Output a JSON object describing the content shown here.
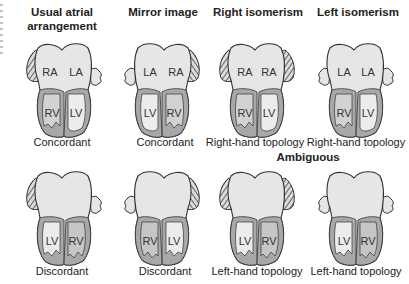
{
  "columns": [
    {
      "title": "Usual atrial arrangement",
      "title_line1": "Usual atrial",
      "title_line2": "arrangement"
    },
    {
      "title": "Mirror image"
    },
    {
      "title": "Right isomerism"
    },
    {
      "title": "Left isomerism"
    }
  ],
  "section_label": "Ambiguous",
  "top_row": [
    {
      "left_atrium": "RA",
      "right_atrium": "LA",
      "left_ventricle": "RV",
      "right_ventricle": "LV",
      "caption": "Concordant"
    },
    {
      "left_atrium": "LA",
      "right_atrium": "RA",
      "left_ventricle": "LV",
      "right_ventricle": "RV",
      "caption": "Concordant"
    },
    {
      "left_atrium": "RA",
      "right_atrium": "RA",
      "left_ventricle": "RV",
      "right_ventricle": "LV",
      "caption": "Right-hand topology"
    },
    {
      "left_atrium": "LA",
      "right_atrium": "LA",
      "left_ventricle": "RV",
      "right_ventricle": "LV",
      "caption": "Right-hand topology"
    }
  ],
  "bottom_row": [
    {
      "left_ventricle": "LV",
      "right_ventricle": "RV",
      "caption": "Discordant"
    },
    {
      "left_ventricle": "RV",
      "right_ventricle": "LV",
      "caption": "Discordant"
    },
    {
      "left_ventricle": "LV",
      "right_ventricle": "RV",
      "caption": "Left-hand topology"
    },
    {
      "left_ventricle": "LV",
      "right_ventricle": "RV",
      "caption": "Left-hand topology"
    }
  ],
  "colors": {
    "atrium_fill": "#e6e6e6",
    "rv_fill": "#bdbdbd",
    "lv_fill": "#ececec",
    "wall_fill": "#a8a8a8",
    "outline": "#333333",
    "appendage_hatch": "#555555"
  }
}
